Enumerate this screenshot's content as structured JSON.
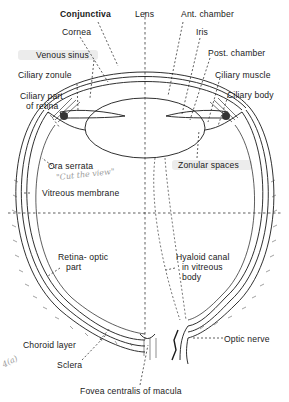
{
  "diagram": {
    "labels": [
      {
        "id": "conjunctiva",
        "text": "Conjunctiva"
      },
      {
        "id": "lens",
        "text": "Lens"
      },
      {
        "id": "ant-chamber",
        "text": "Ant. chamber"
      },
      {
        "id": "cornea",
        "text": "Cornea"
      },
      {
        "id": "iris",
        "text": "Iris"
      },
      {
        "id": "venous-sinus",
        "text": "Venous sinus"
      },
      {
        "id": "post-chamber",
        "text": "Post. chamber"
      },
      {
        "id": "ciliary-zonule",
        "text": "Ciliary zonule"
      },
      {
        "id": "ciliary-muscle",
        "text": "Ciliary muscle"
      },
      {
        "id": "ciliary-part-retina-1",
        "text": "Ciliary part"
      },
      {
        "id": "ciliary-part-retina-2",
        "text": "of retina"
      },
      {
        "id": "ciliary-body",
        "text": "Ciliary body"
      },
      {
        "id": "ora-serrata",
        "text": "Ora serrata"
      },
      {
        "id": "zonular-spaces",
        "text": "Zonular spaces"
      },
      {
        "id": "vitreous-membrane",
        "text": "Vitreous membrane"
      },
      {
        "id": "retina-optic-1",
        "text": "Retina- optic"
      },
      {
        "id": "retina-optic-2",
        "text": "part"
      },
      {
        "id": "hyaloid-1",
        "text": "Hyaloid canal"
      },
      {
        "id": "hyaloid-2",
        "text": "in vitreous"
      },
      {
        "id": "hyaloid-3",
        "text": "body"
      },
      {
        "id": "choroid",
        "text": "Choroid layer"
      },
      {
        "id": "optic-nerve",
        "text": "Optic nerve"
      },
      {
        "id": "sclera",
        "text": "Sclera"
      },
      {
        "id": "fovea",
        "text": "Fovea centralis of macula"
      }
    ],
    "handwritten": [
      {
        "id": "cut-the-view",
        "text": "\"Cut the view\""
      },
      {
        "id": "margin-note",
        "text": "4(a)"
      }
    ],
    "colors": {
      "ink": "#1a1a1a",
      "pencil": "#9a9a9a",
      "background": "#ffffff"
    }
  }
}
